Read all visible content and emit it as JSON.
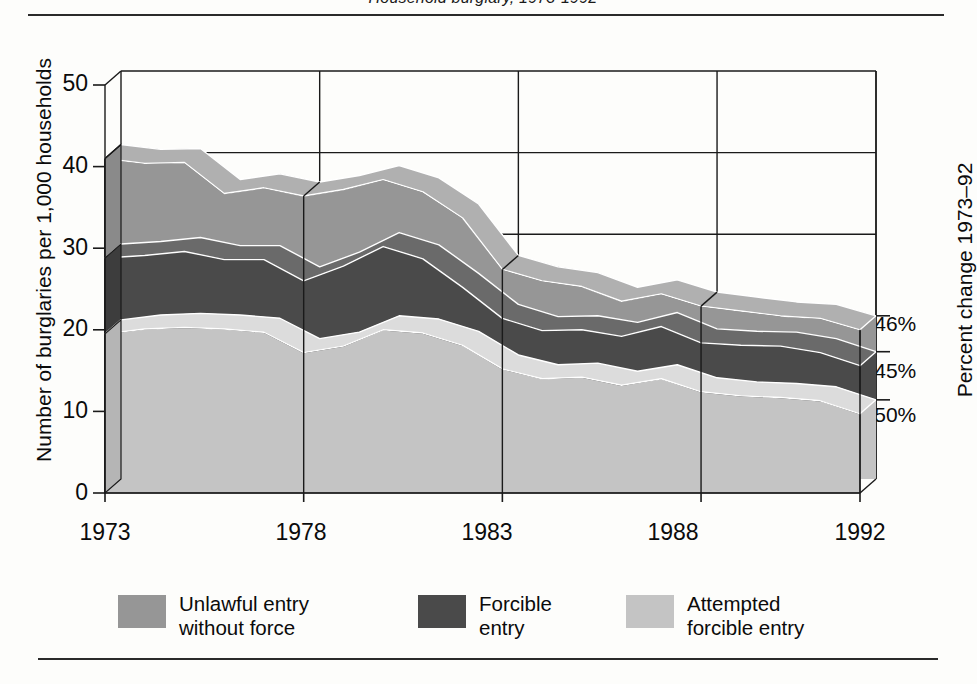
{
  "figure": {
    "title": "Household burglary, 1973-1992",
    "top_rule": "divider",
    "bottom_rule": "divider"
  },
  "axes": {
    "y_left": {
      "label": "Number of burglaries per 1,000 households",
      "ticks": [
        "50",
        "40",
        "30",
        "20",
        "10",
        "0"
      ],
      "tick_values": [
        50,
        40,
        30,
        20,
        10,
        0
      ],
      "min": 0,
      "max": 50
    },
    "y_right": {
      "label": "Percent change 1973–92",
      "ticks": [
        "−46%",
        "−45%",
        "−50%"
      ],
      "tick_series": [
        "Unlawful entry without force",
        "Forcible entry",
        "Attempted forcible entry"
      ]
    },
    "x": {
      "ticks": [
        "1973",
        "1978",
        "1983",
        "1988",
        "1992"
      ],
      "tick_values": [
        1973,
        1978,
        1983,
        1988,
        1992
      ],
      "min": 1973,
      "max": 1992
    }
  },
  "legend": [
    {
      "label": "Unlawful entry\nwithout force",
      "color": "#969696",
      "name": "unlawful-entry-without-force"
    },
    {
      "label": "Forcible\nentry",
      "color": "#4a4a4a",
      "name": "forcible-entry"
    },
    {
      "label": "Attempted\nforcible entry",
      "color": "#c4c4c4",
      "name": "attempted-forcible-entry"
    }
  ],
  "colors": {
    "unlawful_entry": "#969696",
    "forcible_entry": "#4a4a4a",
    "attempted_entry": "#c4c4c4",
    "side_unlawful": "#8a8a8a",
    "side_forcible": "#3d3d3d",
    "side_attempted": "#b5b5b5",
    "top_unlawful": "#b0b0b0",
    "top_forcible": "#6a6a6a",
    "top_attempted": "#dcdcdc",
    "axis": "#1a1a1a",
    "background": "#fdfdfb"
  },
  "chart_data": {
    "type": "area",
    "stacked": true,
    "title": "Household burglary, 1973-1992",
    "xlabel": "",
    "ylabel": "Number of burglaries per 1,000 households",
    "ylim": [
      0,
      50
    ],
    "xlim": [
      1973,
      1992
    ],
    "grid": true,
    "legend_position": "bottom",
    "categories": [
      1973,
      1974,
      1975,
      1976,
      1977,
      1978,
      1979,
      1980,
      1981,
      1982,
      1983,
      1984,
      1985,
      1986,
      1987,
      1988,
      1989,
      1990,
      1991,
      1992
    ],
    "series": [
      {
        "name": "Attempted forcible entry",
        "color": "#c4c4c4",
        "percent_change_1973_92": "−50%",
        "values": [
          19.5,
          20.1,
          20.3,
          20.1,
          19.7,
          17.2,
          18.0,
          20.0,
          19.6,
          18.1,
          15.2,
          14.0,
          14.2,
          13.2,
          14.0,
          12.4,
          11.9,
          11.7,
          11.3,
          9.7
        ]
      },
      {
        "name": "Forcible entry",
        "color": "#4a4a4a",
        "percent_change_1973_92": "−45%",
        "values": [
          9.3,
          9.0,
          9.3,
          8.5,
          8.9,
          8.8,
          9.8,
          10.2,
          9.1,
          7.1,
          6.2,
          5.9,
          5.8,
          6.0,
          6.4,
          6.0,
          6.2,
          6.3,
          5.9,
          5.9
        ]
      },
      {
        "name": "Unlawful entry without force",
        "color": "#969696",
        "percent_change_1973_92": "−46%",
        "values": [
          12.2,
          11.3,
          10.9,
          8.1,
          8.8,
          10.4,
          9.4,
          8.2,
          8.2,
          8.5,
          6.0,
          6.1,
          5.3,
          4.3,
          4.0,
          4.5,
          4.2,
          3.7,
          4.2,
          4.4
        ]
      }
    ],
    "totals": [
      41.0,
      40.4,
      40.5,
      36.7,
      37.4,
      36.4,
      37.2,
      38.4,
      36.9,
      33.7,
      27.4,
      26.0,
      25.3,
      23.5,
      24.4,
      22.9,
      22.3,
      21.7,
      21.4,
      20.0
    ]
  }
}
